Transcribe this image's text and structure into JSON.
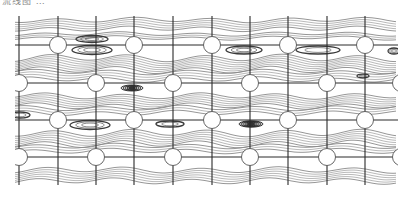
{
  "figure": {
    "caption_fragment": "流线图 …",
    "frame": {
      "x0": 15,
      "x1": 398,
      "y0": 16,
      "y1": 185
    },
    "colors": {
      "line": "#2a2a2a",
      "stream": "#8a8a8a",
      "vortex": "#3a3a3a",
      "circle_fill": "#ffffff"
    },
    "vertical_lines": [
      19,
      58,
      96,
      134,
      173,
      212,
      250,
      288,
      327,
      365
    ],
    "horizontal_lines": [
      45,
      83,
      120,
      157
    ],
    "circle_radius": 8.5,
    "cylinders": [
      {
        "cx": 58,
        "cy": 45
      },
      {
        "cx": 134,
        "cy": 45
      },
      {
        "cx": 212,
        "cy": 45
      },
      {
        "cx": 288,
        "cy": 45
      },
      {
        "cx": 365,
        "cy": 45
      },
      {
        "cx": 19,
        "cy": 83
      },
      {
        "cx": 96,
        "cy": 83
      },
      {
        "cx": 173,
        "cy": 83
      },
      {
        "cx": 250,
        "cy": 83
      },
      {
        "cx": 327,
        "cy": 83
      },
      {
        "cx": 401,
        "cy": 83
      },
      {
        "cx": 58,
        "cy": 120
      },
      {
        "cx": 134,
        "cy": 120
      },
      {
        "cx": 212,
        "cy": 120
      },
      {
        "cx": 288,
        "cy": 120
      },
      {
        "cx": 365,
        "cy": 120
      },
      {
        "cx": 19,
        "cy": 157
      },
      {
        "cx": 96,
        "cy": 157
      },
      {
        "cx": 173,
        "cy": 157
      },
      {
        "cx": 250,
        "cy": 157
      },
      {
        "cx": 327,
        "cy": 157
      },
      {
        "cx": 401,
        "cy": 157
      }
    ],
    "vortices": [
      {
        "cx": 92,
        "cy": 39,
        "rx": 16,
        "ry": 3.5,
        "rings": 3,
        "dense": false
      },
      {
        "cx": 92,
        "cy": 50,
        "rx": 20,
        "ry": 4.5,
        "rings": 3,
        "dense": false
      },
      {
        "cx": 132,
        "cy": 88,
        "rx": 11,
        "ry": 3,
        "rings": 5,
        "dense": true
      },
      {
        "cx": 244,
        "cy": 50,
        "rx": 18,
        "ry": 4,
        "rings": 3,
        "dense": false
      },
      {
        "cx": 318,
        "cy": 50,
        "rx": 22,
        "ry": 4,
        "rings": 2,
        "dense": false
      },
      {
        "cx": 394,
        "cy": 51,
        "rx": 6,
        "ry": 3,
        "rings": 3,
        "dense": false
      },
      {
        "cx": 363,
        "cy": 76,
        "rx": 6,
        "ry": 1.8,
        "rings": 2,
        "dense": false
      },
      {
        "cx": 20,
        "cy": 115,
        "rx": 10,
        "ry": 3,
        "rings": 2,
        "dense": false
      },
      {
        "cx": 90,
        "cy": 125,
        "rx": 20,
        "ry": 4.5,
        "rings": 3,
        "dense": false
      },
      {
        "cx": 170,
        "cy": 124,
        "rx": 14,
        "ry": 3,
        "rings": 2,
        "dense": false
      },
      {
        "cx": 251,
        "cy": 124,
        "rx": 12,
        "ry": 3.2,
        "rings": 6,
        "dense": true
      }
    ],
    "streamline_bands": [
      {
        "y": 20,
        "count": 5,
        "gap": 2.2,
        "amp": 2.0,
        "phase": 0.0
      },
      {
        "y": 34,
        "count": 3,
        "gap": 2.0,
        "amp": 1.5,
        "phase": 1.2
      },
      {
        "y": 58,
        "count": 7,
        "gap": 2.0,
        "amp": 3.0,
        "phase": 0.6
      },
      {
        "y": 72,
        "count": 4,
        "gap": 2.5,
        "amp": 2.0,
        "phase": 2.0
      },
      {
        "y": 96,
        "count": 6,
        "gap": 2.0,
        "amp": 2.5,
        "phase": 1.0
      },
      {
        "y": 108,
        "count": 3,
        "gap": 2.5,
        "amp": 2.0,
        "phase": 2.6
      },
      {
        "y": 133,
        "count": 6,
        "gap": 2.2,
        "amp": 3.0,
        "phase": 0.3
      },
      {
        "y": 146,
        "count": 3,
        "gap": 2.5,
        "amp": 2.0,
        "phase": 1.7
      },
      {
        "y": 170,
        "count": 6,
        "gap": 2.2,
        "amp": 2.5,
        "phase": 0.9
      }
    ]
  }
}
